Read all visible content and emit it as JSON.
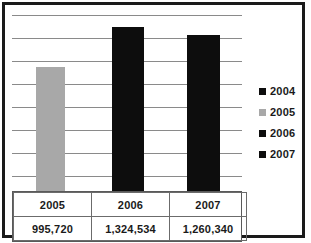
{
  "chart_data": {
    "type": "bar",
    "title": "",
    "xlabel": "",
    "ylabel": "",
    "grid": true,
    "legend_position": "right",
    "categories": [
      "2005",
      "2006",
      "2007"
    ],
    "values": [
      995720,
      1324534,
      1260340
    ],
    "value_labels": [
      "995,720",
      "1,324,534",
      "1,260,340"
    ],
    "bar_colors": [
      "#a8a8a8",
      "#0d0d0d",
      "#0d0d0d"
    ],
    "ylim": [
      0,
      1450000
    ],
    "gridline_count": 8,
    "series": [
      {
        "name": "2005",
        "values": [
          995720,
          null,
          null
        ]
      },
      {
        "name": "2006",
        "values": [
          null,
          1324534,
          null
        ]
      },
      {
        "name": "2007",
        "values": [
          null,
          null,
          1260340
        ]
      }
    ],
    "legend": [
      {
        "label": "2004",
        "color": "#0d0d0d"
      },
      {
        "label": "2005",
        "color": "#a8a8a8"
      },
      {
        "label": "2006",
        "color": "#0d0d0d"
      },
      {
        "label": "2007",
        "color": "#0d0d0d"
      }
    ],
    "table": {
      "rows": [
        [
          "2005",
          "2006",
          "2007"
        ],
        [
          "995,720",
          "1,324,534",
          "1,260,340"
        ]
      ]
    }
  },
  "colors": {
    "bar_dark": "#0d0d0d",
    "bar_gray": "#a8a8a8",
    "gridline": "#8a8a8a",
    "frame": "#1a1a1a",
    "table_border": "#6b6b6b",
    "text": "#1a1a1a",
    "background": "#ffffff"
  }
}
